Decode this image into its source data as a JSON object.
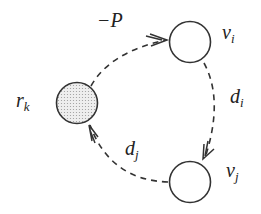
{
  "diagram": {
    "type": "cycle-graph",
    "colors": {
      "stroke": "#333333",
      "node_fill": "#ffffff",
      "special_node_fill": "#e6e6e6",
      "text": "#222222"
    },
    "nodes": [
      {
        "id": "vi",
        "label_base": "v",
        "label_sub": "i",
        "fill": "white"
      },
      {
        "id": "vj",
        "label_base": "v",
        "label_sub": "j",
        "fill": "white"
      },
      {
        "id": "rk",
        "label_base": "r",
        "label_sub": "k",
        "fill": "dotted-gray"
      }
    ],
    "edges": [
      {
        "from": "rk",
        "to": "vi",
        "style": "dashed",
        "label": "−P"
      },
      {
        "from": "vi",
        "to": "vj",
        "style": "dashed",
        "label_base": "d",
        "label_sub": "i"
      },
      {
        "from": "vj",
        "to": "rk",
        "style": "dashed",
        "label_base": "d",
        "label_sub": "j"
      }
    ]
  }
}
